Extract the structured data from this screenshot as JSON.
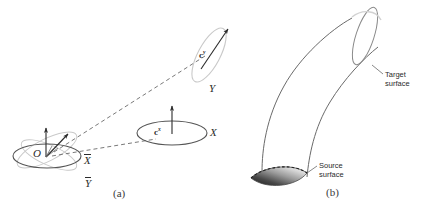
{
  "figure": {
    "kind": "two-panel-scientific-diagram",
    "background_color": "#ffffff",
    "ink_color": "#2b2b2b",
    "faint_color": "#c9c9c9",
    "panels": [
      {
        "id": "a",
        "caption": "(a)",
        "description": "coordinate frame with source ellipse at origin O and mapped ellipses along directions X and Y"
      },
      {
        "id": "b",
        "caption": "(b)",
        "description": "curved tube connecting a shaded source surface to a target surface"
      }
    ]
  },
  "panel_a": {
    "caption": "(a)",
    "origin_label": "O",
    "axis_x_bar": "X",
    "axis_y_bar": "Y",
    "axis_x": "X",
    "axis_y": "Y",
    "vector_cx": "c",
    "vector_cx_sup": "x",
    "vector_cy": "c",
    "vector_cy_sup": "y"
  },
  "panel_b": {
    "caption": "(b)",
    "target_label_line1": "Target",
    "target_label_line2": "surface",
    "source_label_line1": "Source",
    "source_label_line2": "surface"
  }
}
